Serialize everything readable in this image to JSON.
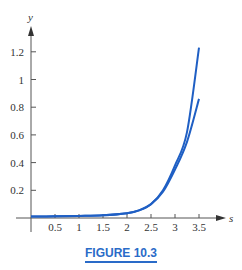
{
  "chart_data": {
    "type": "line",
    "title": "",
    "xlabel": "s",
    "ylabel": "y",
    "xlim": [
      0,
      3.6
    ],
    "ylim": [
      0,
      1.3
    ],
    "x_ticks": [
      "0.5",
      "1",
      "1.5",
      "2",
      "2.5",
      "3",
      "3.5"
    ],
    "y_ticks": [
      "0.2",
      "0.4",
      "0.6",
      "0.8",
      "1",
      "1.2"
    ],
    "grid": false,
    "legend": null,
    "x": [
      0,
      0.5,
      1,
      1.5,
      2,
      2.25,
      2.5,
      2.75,
      3,
      3.25,
      3.5
    ],
    "series": [
      {
        "name": "upper curve",
        "values": [
          0.01,
          0.012,
          0.015,
          0.02,
          0.035,
          0.055,
          0.1,
          0.2,
          0.38,
          0.62,
          1.23
        ]
      },
      {
        "name": "lower curve",
        "values": [
          0.01,
          0.012,
          0.015,
          0.02,
          0.035,
          0.055,
          0.1,
          0.19,
          0.35,
          0.55,
          0.86
        ]
      }
    ],
    "line_color": "#1f5fc4"
  },
  "caption": {
    "text": "FIGURE 10.3",
    "color": "#2a6bc8"
  }
}
